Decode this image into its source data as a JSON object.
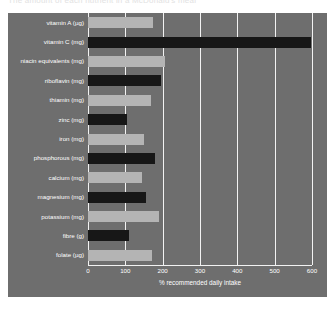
{
  "page": {
    "cropped_title": "The amount of each nutrient in a McDonald's meal"
  },
  "chart_data": {
    "type": "bar",
    "orientation": "horizontal",
    "title": "",
    "xlabel": "% recommended daily intake",
    "ylabel": "",
    "xlim": [
      0,
      600
    ],
    "xticks": [
      0,
      100,
      200,
      300,
      400,
      500,
      600
    ],
    "grid": true,
    "legend": "none",
    "colors": {
      "bar_light": "#b4b4b4",
      "bar_dark": "#171717",
      "panel_background": "#6e6e6e",
      "gridline": "#f2f2f2",
      "text": "#ffffff"
    },
    "categories": [
      "vitamin A (µg)",
      "vitamin C (mg)",
      "niacin equivalents (mg)",
      "riboflavin (mg)",
      "thiamin (mg)",
      "zinc (mg)",
      "iron (mg)",
      "phosphorous (mg)",
      "calcium (mg)",
      "magnesium (mg)",
      "potassium (mg)",
      "fibre (g)",
      "folate (µg)"
    ],
    "values": [
      175,
      598,
      205,
      195,
      168,
      105,
      150,
      180,
      145,
      155,
      190,
      110,
      172
    ],
    "bar_shades": [
      "light",
      "dark",
      "light",
      "dark",
      "light",
      "dark",
      "light",
      "dark",
      "light",
      "dark",
      "light",
      "dark",
      "light"
    ]
  }
}
